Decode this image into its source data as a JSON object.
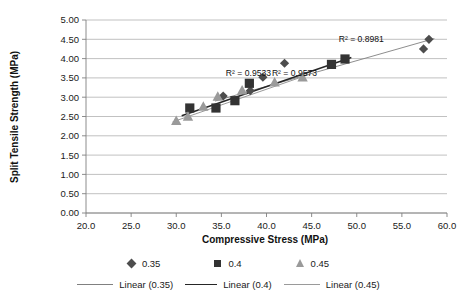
{
  "chart_data": {
    "type": "scatter",
    "title": "",
    "xlabel": "Compressive Stress (MPa)",
    "ylabel": "Split Tensile Strength (MPa)",
    "xlim": [
      20.0,
      60.0
    ],
    "ylim": [
      0.0,
      5.0
    ],
    "xticks": [
      "20.0",
      "25.0",
      "30.0",
      "35.0",
      "40.0",
      "45.0",
      "50.0",
      "55.0",
      "60.0"
    ],
    "yticks": [
      "0.00",
      "0.50",
      "1.00",
      "1.50",
      "2.00",
      "2.50",
      "3.00",
      "3.50",
      "4.00",
      "4.50",
      "5.00"
    ],
    "xtick_step": 5.0,
    "ytick_step": 0.5,
    "grid": "horizontal",
    "legend_position": "bottom",
    "series": [
      {
        "name": "0.35",
        "marker": "diamond",
        "color": "#4d4d4d",
        "points": [
          {
            "x": 35.2,
            "y": 3.03
          },
          {
            "x": 38.2,
            "y": 3.17
          },
          {
            "x": 39.6,
            "y": 3.52
          },
          {
            "x": 42.0,
            "y": 3.88
          },
          {
            "x": 57.4,
            "y": 4.25
          },
          {
            "x": 58.0,
            "y": 4.5
          }
        ]
      },
      {
        "name": "0.4",
        "marker": "square",
        "color": "#333333",
        "points": [
          {
            "x": 31.5,
            "y": 2.72
          },
          {
            "x": 34.4,
            "y": 2.72
          },
          {
            "x": 36.5,
            "y": 2.91
          },
          {
            "x": 38.1,
            "y": 3.36
          },
          {
            "x": 47.2,
            "y": 3.85
          },
          {
            "x": 48.7,
            "y": 3.99
          }
        ]
      },
      {
        "name": "0.45",
        "marker": "triangle",
        "color": "#9a9a9a",
        "points": [
          {
            "x": 30.0,
            "y": 2.39
          },
          {
            "x": 31.3,
            "y": 2.5
          },
          {
            "x": 33.0,
            "y": 2.76
          },
          {
            "x": 34.6,
            "y": 3.02
          },
          {
            "x": 37.3,
            "y": 3.18
          },
          {
            "x": 40.9,
            "y": 3.39
          },
          {
            "x": 44.0,
            "y": 3.52
          }
        ]
      }
    ],
    "trendlines": [
      {
        "name": "Linear (0.35)",
        "color": "#808080",
        "width": 0.9,
        "x_start": 34.3,
        "y_start": 2.9,
        "x_end": 58.6,
        "y_end": 4.52,
        "r2_label": "R² = 0.8981",
        "r2_value": 0.8981
      },
      {
        "name": "Linear (0.4)",
        "color": "#262626",
        "width": 1.5,
        "x_start": 30.6,
        "y_start": 2.52,
        "x_end": 49.4,
        "y_end": 4.03,
        "r2_label": "R² = 0.9533",
        "r2_value": 0.9533
      },
      {
        "name": "Linear (0.45)",
        "color": "#9a9a9a",
        "width": 1.0,
        "x_start": 29.6,
        "y_start": 2.36,
        "x_end": 44.6,
        "y_end": 3.58,
        "r2_label": "R² = 0.9573",
        "r2_value": 0.9573
      }
    ],
    "annotations": [
      {
        "text": "R² = 0.8981",
        "x": 50.5,
        "y": 4.42
      },
      {
        "text": "R² = 0.9533",
        "x": 38.0,
        "y": 3.54
      },
      {
        "text": "R² = 0.9573",
        "x": 43.1,
        "y": 3.54
      }
    ]
  },
  "legend": {
    "markers": [
      {
        "label": "0.35",
        "shape": "diamond"
      },
      {
        "label": "0.4",
        "shape": "square"
      },
      {
        "label": "0.45",
        "shape": "triangle"
      }
    ],
    "lines": [
      {
        "label": "Linear (0.35)",
        "shape": "line"
      },
      {
        "label": "Linear (0.4)",
        "shape": "line"
      },
      {
        "label": "Linear (0.45)",
        "shape": "line"
      }
    ]
  }
}
